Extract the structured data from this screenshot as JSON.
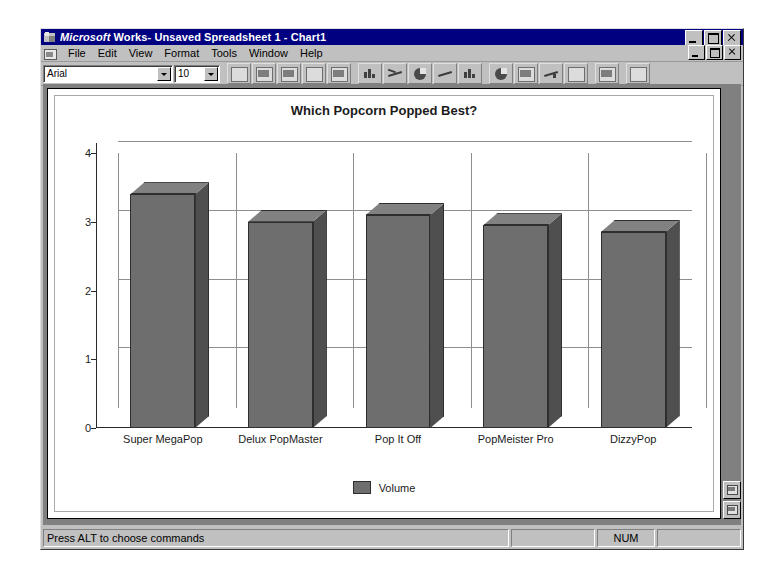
{
  "window": {
    "title_brand": "Microsoft",
    "title_rest": "Works- Unsaved Spreadsheet 1 - Chart1",
    "title_full": "Microsoft Works- Unsaved Spreadsheet 1 - Chart1",
    "app_icon": "works-logo-icon",
    "doc_icon": "document-control-icon",
    "buttons": {
      "minimize": "minimize-icon",
      "maximize": "maximize-icon",
      "close": "close-icon"
    }
  },
  "menubar": {
    "items": [
      {
        "label": "File"
      },
      {
        "label": "Edit"
      },
      {
        "label": "View"
      },
      {
        "label": "Format"
      },
      {
        "label": "Tools"
      },
      {
        "label": "Window"
      },
      {
        "label": "Help"
      }
    ]
  },
  "toolbar": {
    "font_name": "Arial",
    "font_size": "10",
    "buttons": [
      {
        "name": "new-document-button",
        "icon": "new-document-icon"
      },
      {
        "name": "save-button",
        "icon": "floppy-disk-icon"
      },
      {
        "name": "print-button",
        "icon": "printer-icon"
      },
      {
        "name": "print-preview-button",
        "icon": "print-preview-icon"
      },
      {
        "name": "copy-button",
        "icon": "copy-icon"
      },
      {
        "name": "paste-button",
        "icon": "clipboard-icon"
      },
      {
        "name": "bar-chart-button",
        "icon": "bar-chart-icon"
      },
      {
        "name": "line-chart-button",
        "icon": "line-chart-icon"
      },
      {
        "name": "pie-chart-button",
        "icon": "pie-chart-icon"
      },
      {
        "name": "area-chart-button",
        "icon": "area-chart-icon"
      },
      {
        "name": "stacked-chart-button",
        "icon": "stacked-bar-icon"
      },
      {
        "name": "xy-chart-button",
        "icon": "scatter-chart-icon"
      },
      {
        "name": "radar-chart-button",
        "icon": "radar-chart-icon"
      },
      {
        "name": "combo-chart-button",
        "icon": "combo-chart-icon"
      },
      {
        "name": "mixed-chart-button",
        "icon": "mixed-chart-icon"
      },
      {
        "name": "chart-3d-button",
        "icon": "cube-3d-icon"
      },
      {
        "name": "help-mode-button",
        "icon": "help-pointer-icon"
      }
    ]
  },
  "chart_data": {
    "type": "bar",
    "title": "Which Popcorn Popped Best?",
    "xlabel": "",
    "ylabel": "",
    "categories": [
      "Super MegaPop",
      "Delux PopMaster",
      "Pop It Off",
      "PopMeister Pro",
      "DizzyPop"
    ],
    "series": [
      {
        "name": "Volume",
        "values": [
          3.4,
          3.0,
          3.1,
          2.95,
          2.85
        ]
      }
    ],
    "values": [
      3.4,
      3.0,
      3.1,
      2.95,
      2.85
    ],
    "yticks": [
      "0",
      "1",
      "2",
      "3",
      "4"
    ],
    "ylim": [
      0,
      4
    ],
    "grid": true,
    "legend_position": "bottom",
    "legend_entries": [
      "Volume"
    ],
    "bar_color": "#6e6e6e",
    "bar_side_color": "#4f4f4f",
    "bar_top_color": "#818181",
    "three_d": true
  },
  "statusbar": {
    "message": "Press ALT to choose commands",
    "cell_blank1": "",
    "num_indicator": "NUM",
    "cell_blank2": ""
  },
  "side_buttons": [
    {
      "name": "chart-view-button",
      "icon": "chart-view-icon"
    },
    {
      "name": "spreadsheet-view-button",
      "icon": "spreadsheet-view-icon"
    }
  ]
}
